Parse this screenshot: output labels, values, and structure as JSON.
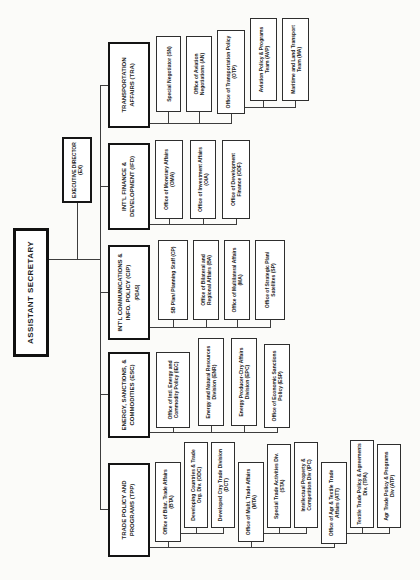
{
  "document": {
    "type": "organization-chart",
    "paper_color": "#fbfbf9",
    "ink_color": "#1c1c1c",
    "root": "ASSISTANT SECRETARY",
    "executive_director": {
      "title": "EXECUTIVE DIRECTOR",
      "code": "(EX)"
    },
    "tpp": {
      "header": "TRADE POLICY AND PROGRAMS (TPP)",
      "bta": "Office of Bilat. Trade Affairs (BTA)",
      "odc": "Developing Countries & Trade Org. Div. (ODC)",
      "dct": "Developed Ctry Trade Division (DCT)",
      "mta": "Office of Multi. Trade Affairs (MTA)",
      "sta": "Special Trade Activities Div. (STA)",
      "ipc": "Intellectual Property & Competition Div (IPC)",
      "att": "Office of Agr & Textile Trade Affairs (ATT)",
      "tpa": "Textile Trade Policy & Agreements Div. (TPA)",
      "atp": "Agr Trade Policy & Programs Div (ATP)"
    },
    "esc": {
      "header": "ENERGY, SANCTIONS, & COMMODITIES (ESC)",
      "iec": "Office of Intl. Energy and Commodity Policy (IEC)",
      "enr": "Energy and Natural Resources Division (ENR)",
      "epc": "Energy Producer-Ctry Affairs Division (EPC)",
      "esp": "Office of Economic Sanctions Policy (ESP)"
    },
    "cip": {
      "header": "INT'L COMMUNICATIONS & INFO. POLICY (CIP)",
      "pdas": "(PDAS)",
      "cp": "SB Plan/ Planning Staff (CP)",
      "ba": "Office of Bilateral and Regional Affairs (BA)",
      "ma": "Office of Multilateral Affairs (MA)",
      "sp": "Office of Strategic Plan/ Satellites (SP)"
    },
    "ifd": {
      "header": "INT'L FINANCE & DEVELOPMENT (IFD)",
      "oma": "Office of Monetary Affairs (OMA)",
      "oia": "Office of Investment Affairs (OIA)",
      "odf": "Office of Development Finance (ODF)"
    },
    "tra": {
      "header": "TRANSPORTATION AFFAIRS (TRA)",
      "sn": "Special Negotiator (SN)",
      "an": "Office of Aviation Negotiations (AN)",
      "otp": "Office of Transportation Policy (OTP)",
      "avp": "Aviation Policy & Programs Team (AVP)",
      "mlt": "Maritime and Land Transport Team (MA)"
    }
  }
}
